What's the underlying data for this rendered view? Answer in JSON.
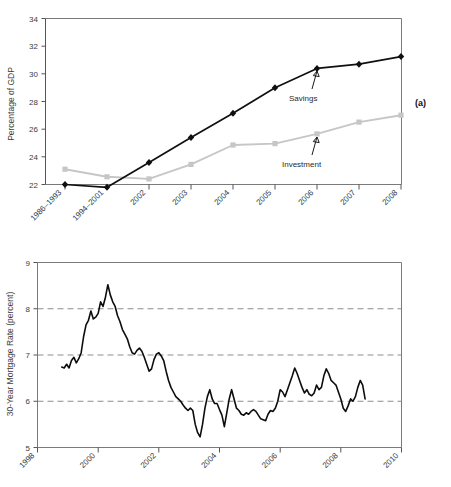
{
  "figure": {
    "panel_a_label": "(a)",
    "panel_b_label": "(b)"
  },
  "chart_data": [
    {
      "type": "line",
      "panel": "(a)",
      "title": "",
      "xlabel": "",
      "ylabel": "Percentage of GDP",
      "ylim": [
        22,
        34
      ],
      "yticks": [
        22,
        24,
        26,
        28,
        30,
        32,
        34
      ],
      "ytick_labels": [
        "22",
        "24",
        "26",
        "28",
        "30",
        "32",
        "34"
      ],
      "grid": false,
      "legend_position": "inline-annotations",
      "categories": [
        "1986–1993",
        "1994–2001",
        "2002",
        "2003",
        "2004",
        "2005",
        "2006",
        "2007",
        "2008"
      ],
      "series": [
        {
          "name": "Savings",
          "color": "#101010",
          "marker": "diamond",
          "values": [
            24.3,
            24.1,
            25.9,
            27.7,
            29.45,
            31.3,
            32.7,
            33.0,
            33.55
          ],
          "annotation": {
            "label": "Savings",
            "points_to_category": "2006"
          }
        },
        {
          "name": "Investment",
          "color": "#c6c6c6",
          "marker": "square",
          "values": [
            25.4,
            24.85,
            24.7,
            25.75,
            27.15,
            27.25,
            27.95,
            28.8,
            29.3
          ],
          "annotation": {
            "label": "Investment",
            "points_to_category": "2006"
          }
        }
      ]
    },
    {
      "type": "line",
      "panel": "(b)",
      "title": "",
      "xlabel": "",
      "ylabel": "30-Year Mortgage Rate (percent)",
      "ylim": [
        5,
        9
      ],
      "yticks": [
        5,
        6,
        7,
        8,
        9
      ],
      "ytick_labels": [
        "5",
        "6",
        "7",
        "8",
        "9"
      ],
      "xlim": [
        1998,
        2010
      ],
      "xticks": [
        1998,
        2000,
        2002,
        2004,
        2006,
        2008,
        2010
      ],
      "xtick_labels": [
        "1998",
        "2000",
        "2002",
        "2004",
        "2006",
        "2008",
        "2010"
      ],
      "grid": "horizontal-dashed at 6, 7, 8",
      "series": [
        {
          "name": "30-Year Mortgage Rate",
          "color": "#0d0d0d",
          "marker": "none",
          "x": [
            1998.8,
            1998.88,
            1998.96,
            1999.04,
            1999.12,
            1999.2,
            1999.28,
            1999.36,
            1999.44,
            1999.52,
            1999.6,
            1999.68,
            1999.76,
            1999.84,
            1999.92,
            2000.0,
            2000.08,
            2000.16,
            2000.24,
            2000.32,
            2000.4,
            2000.48,
            2000.56,
            2000.64,
            2000.72,
            2000.8,
            2000.88,
            2000.96,
            2001.04,
            2001.12,
            2001.2,
            2001.28,
            2001.36,
            2001.44,
            2001.52,
            2001.6,
            2001.68,
            2001.76,
            2001.84,
            2001.92,
            2002.0,
            2002.08,
            2002.16,
            2002.24,
            2002.32,
            2002.4,
            2002.48,
            2002.56,
            2002.64,
            2002.72,
            2002.8,
            2002.88,
            2002.96,
            2003.04,
            2003.12,
            2003.2,
            2003.28,
            2003.36,
            2003.44,
            2003.52,
            2003.6,
            2003.68,
            2003.76,
            2003.84,
            2003.92,
            2004.0,
            2004.08,
            2004.16,
            2004.24,
            2004.32,
            2004.4,
            2004.48,
            2004.56,
            2004.64,
            2004.72,
            2004.8,
            2004.88,
            2004.96,
            2005.04,
            2005.12,
            2005.2,
            2005.28,
            2005.36,
            2005.44,
            2005.52,
            2005.6,
            2005.68,
            2005.76,
            2005.84,
            2005.92,
            2006.0,
            2006.08,
            2006.16,
            2006.24,
            2006.32,
            2006.4,
            2006.48,
            2006.56,
            2006.64,
            2006.72,
            2006.8,
            2006.88,
            2006.96,
            2007.04,
            2007.12,
            2007.2,
            2007.28,
            2007.36,
            2007.44,
            2007.52,
            2007.6,
            2007.68,
            2007.76,
            2007.84,
            2007.92,
            2008.0,
            2008.08,
            2008.16,
            2008.24,
            2008.32,
            2008.4,
            2008.48,
            2008.56,
            2008.64,
            2008.72,
            2008.8
          ],
          "y": [
            6.74,
            6.72,
            6.8,
            6.72,
            6.88,
            6.95,
            6.83,
            6.92,
            7.05,
            7.4,
            7.65,
            7.75,
            7.95,
            7.78,
            7.82,
            7.9,
            8.15,
            8.05,
            8.25,
            8.52,
            8.3,
            8.15,
            8.05,
            7.85,
            7.72,
            7.55,
            7.45,
            7.35,
            7.18,
            7.05,
            7.02,
            7.1,
            7.15,
            7.08,
            6.95,
            6.8,
            6.65,
            6.7,
            6.9,
            7.02,
            7.05,
            6.98,
            6.88,
            6.65,
            6.45,
            6.3,
            6.2,
            6.1,
            6.05,
            6.0,
            5.92,
            5.85,
            5.8,
            5.85,
            5.8,
            5.5,
            5.32,
            5.23,
            5.5,
            5.85,
            6.1,
            6.25,
            6.05,
            5.95,
            5.95,
            5.82,
            5.7,
            5.45,
            5.75,
            6.05,
            6.25,
            6.05,
            5.85,
            5.8,
            5.72,
            5.7,
            5.75,
            5.72,
            5.78,
            5.82,
            5.78,
            5.7,
            5.62,
            5.6,
            5.58,
            5.72,
            5.8,
            5.78,
            5.85,
            6.0,
            6.25,
            6.2,
            6.1,
            6.25,
            6.4,
            6.55,
            6.72,
            6.6,
            6.45,
            6.3,
            6.18,
            6.25,
            6.15,
            6.12,
            6.18,
            6.35,
            6.25,
            6.3,
            6.55,
            6.7,
            6.6,
            6.45,
            6.4,
            6.35,
            6.2,
            6.05,
            5.85,
            5.78,
            5.9,
            6.05,
            6.0,
            6.1,
            6.3,
            6.45,
            6.35,
            6.05,
            6.12
          ]
        }
      ]
    }
  ]
}
